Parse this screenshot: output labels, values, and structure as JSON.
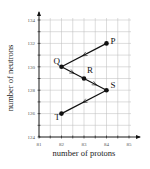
{
  "chart_data": {
    "type": "line",
    "title": "",
    "xlabel": "number of protons",
    "ylabel": "number of neutrons",
    "xlim": [
      81,
      85
    ],
    "ylim": [
      124,
      134
    ],
    "x_ticks": [
      81,
      82,
      83,
      84,
      85
    ],
    "y_ticks": [
      124,
      126,
      128,
      130,
      132,
      134
    ],
    "grid": true,
    "minor_grid_step": {
      "x": 0.5,
      "y": 1
    },
    "points": [
      {
        "label": "P",
        "x": 84,
        "y": 132
      },
      {
        "label": "Q",
        "x": 82,
        "y": 130
      },
      {
        "label": "R",
        "x": 83,
        "y": 129
      },
      {
        "label": "S",
        "x": 84,
        "y": 128
      },
      {
        "label": "T",
        "x": 82,
        "y": 126
      }
    ],
    "path_order": [
      "P",
      "Q",
      "R",
      "S",
      "T"
    ],
    "segments_have_direction_arrows": true,
    "legend": null
  },
  "colors": {
    "line": "#111111",
    "grid": "#bbbbbb",
    "axis": "#111111"
  }
}
